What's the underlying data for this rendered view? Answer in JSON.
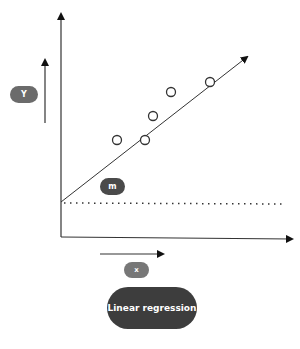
{
  "diagram": {
    "title": "Linear regression",
    "labels": {
      "y": "Y",
      "x": "x",
      "slope": "m"
    },
    "colors": {
      "line": "#222222",
      "pill_y": "#6b6b6b",
      "pill_m": "#4a4a4a",
      "pill_x": "#777777",
      "pill_title": "#3d3d3d",
      "text": "#ffffff"
    },
    "points": [
      {
        "x": 117,
        "y": 140
      },
      {
        "x": 145,
        "y": 140
      },
      {
        "x": 153,
        "y": 116
      },
      {
        "x": 171,
        "y": 92
      },
      {
        "x": 210,
        "y": 82
      }
    ]
  }
}
